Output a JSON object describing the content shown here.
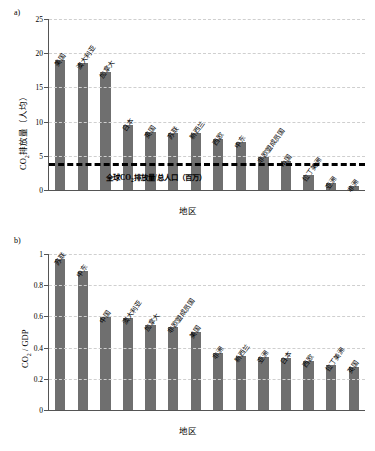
{
  "figure": {
    "panel_a_tag": "a)",
    "panel_b_tag": "b)",
    "bar_color": "#6f6f6f",
    "gridline_color": "#cfcfcf",
    "axis_color": "#555555",
    "refline_color": "#000000"
  },
  "chart_data": [
    {
      "type": "bar",
      "panel": "a)",
      "title": "",
      "xlabel": "地区",
      "ylabel": "CO₂排放量（人均）",
      "ylabel_parts": {
        "pre": "CO",
        "sub": "2",
        "post": "排放量（人均）"
      },
      "ylim": [
        0,
        25
      ],
      "yticks": [
        0,
        5,
        10,
        15,
        20,
        25
      ],
      "ytick_labels": [
        "0",
        "5",
        "10",
        "15",
        "20",
        "25"
      ],
      "grid": true,
      "legend": "none",
      "categories": [
        "美国",
        "澳大利亚",
        "加拿大",
        "日本",
        "英国",
        "苏联",
        "新西兰",
        "西欧",
        "中东",
        "非欧盟成员国",
        "中国",
        "拉丁美洲",
        "亚洲",
        "非洲"
      ],
      "values": [
        19.0,
        18.6,
        17.2,
        9.5,
        8.5,
        8.3,
        8.3,
        7.4,
        7.0,
        4.8,
        4.2,
        2.2,
        1.0,
        0.6
      ],
      "annotations": [
        {
          "type": "hline",
          "value": 3.9,
          "style": "dashed-thick-black",
          "text": "全球CO₂排放量/总人口（百万）",
          "text_parts": {
            "pre": "全球CO",
            "sub": "2",
            "post": "排放量/总人口（百万）"
          }
        }
      ]
    },
    {
      "type": "bar",
      "panel": "b)",
      "title": "",
      "xlabel": "地区",
      "ylabel": "CO₂ / GDP",
      "ylabel_parts": {
        "pre": "CO",
        "sub": "2",
        "post": " / GDP"
      },
      "ylim": [
        0,
        1
      ],
      "yticks": [
        0,
        0.2,
        0.4,
        0.6,
        0.8,
        1
      ],
      "ytick_labels": [
        "0",
        "0.2",
        "0.4",
        "0.6",
        "0.8",
        "1"
      ],
      "grid": true,
      "legend": "none",
      "categories": [
        "苏联",
        "中东",
        "中国",
        "澳大利亚",
        "加拿大",
        "非欧盟成员国",
        "美国",
        "非洲",
        "新西兰",
        "亚洲",
        "日本",
        "西欧",
        "拉丁美洲",
        "英国"
      ],
      "values": [
        0.97,
        0.89,
        0.595,
        0.59,
        0.545,
        0.53,
        0.5,
        0.365,
        0.345,
        0.34,
        0.335,
        0.315,
        0.29,
        0.275
      ]
    }
  ]
}
